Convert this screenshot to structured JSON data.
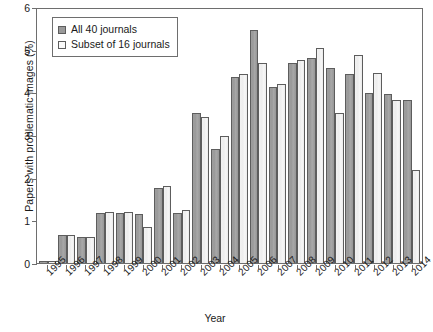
{
  "chart_data": {
    "type": "bar",
    "title": "",
    "xlabel": "Year",
    "ylabel": "Papers with problematic images (%)",
    "ylim": [
      0,
      6
    ],
    "yticks": [
      0,
      1,
      2,
      3,
      4,
      5,
      6
    ],
    "grid": false,
    "legend_position": "upper left",
    "categories": [
      "1995",
      "1996",
      "1997",
      "1998",
      "1999",
      "2000",
      "2001",
      "2002",
      "2003",
      "2004",
      "2005",
      "2006",
      "2007",
      "2008",
      "2009",
      "2010",
      "2011",
      "2012",
      "2013",
      "2014"
    ],
    "series": [
      {
        "name": "All 40 journals",
        "color": "#9a9a9a",
        "values": [
          0.05,
          0.65,
          0.62,
          1.18,
          1.18,
          1.15,
          1.75,
          1.18,
          3.52,
          2.68,
          4.35,
          5.45,
          4.12,
          4.68,
          4.8,
          4.58,
          4.42,
          3.98,
          3.97,
          3.82
        ]
      },
      {
        "name": "Subset of 16 journals",
        "color": "#f2f2f2",
        "values": [
          0.04,
          0.66,
          0.62,
          1.2,
          1.2,
          0.85,
          1.8,
          1.25,
          3.43,
          2.98,
          4.42,
          4.68,
          4.2,
          4.76,
          5.05,
          3.52,
          4.88,
          4.46,
          3.83,
          2.18
        ]
      }
    ]
  },
  "legend": {
    "items": [
      {
        "label": "All 40 journals",
        "swatch": "gray-swatch"
      },
      {
        "label": "Subset of 16 journals",
        "swatch": "white-swatch"
      }
    ]
  },
  "axes": {
    "y_title": "Papers with problematic images (%)",
    "x_title": "Year",
    "y_tick_labels": [
      "0",
      "1",
      "2",
      "3",
      "4",
      "5",
      "6"
    ],
    "x_tick_labels": [
      "1995",
      "1996",
      "1997",
      "1998",
      "1999",
      "2000",
      "2001",
      "2002",
      "2003",
      "2004",
      "2005",
      "2006",
      "2007",
      "2008",
      "2009",
      "2010",
      "2011",
      "2012",
      "2013",
      "2014"
    ]
  }
}
